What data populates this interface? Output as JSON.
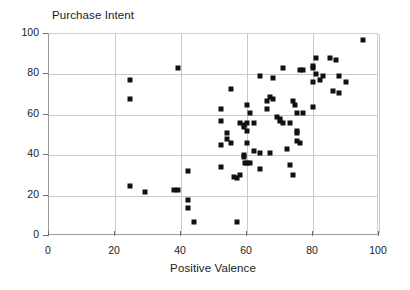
{
  "chart_data": {
    "type": "scatter",
    "title": "Purchase Intent",
    "xlabel": "Positive Valence",
    "ylabel": "Purchase Intent",
    "xlim": [
      0,
      100
    ],
    "ylim": [
      0,
      100
    ],
    "xticks": [
      0,
      20,
      40,
      60,
      80,
      100
    ],
    "yticks": [
      0,
      20,
      40,
      60,
      80,
      100
    ],
    "grid": true,
    "legend": null,
    "marker": "square",
    "marker_color": "#111111",
    "points": [
      [
        24.5,
        77
      ],
      [
        24.5,
        68
      ],
      [
        24.5,
        25
      ],
      [
        29,
        22
      ],
      [
        38,
        23
      ],
      [
        39,
        23
      ],
      [
        39,
        83
      ],
      [
        42,
        32
      ],
      [
        42,
        18
      ],
      [
        42,
        14
      ],
      [
        44,
        7
      ],
      [
        52,
        63
      ],
      [
        52,
        57
      ],
      [
        52,
        45
      ],
      [
        52,
        34
      ],
      [
        55,
        73
      ],
      [
        54,
        51
      ],
      [
        54,
        48
      ],
      [
        55,
        46
      ],
      [
        56,
        29
      ],
      [
        57,
        28.5
      ],
      [
        57,
        7
      ],
      [
        58,
        30
      ],
      [
        58,
        56
      ],
      [
        59,
        55
      ],
      [
        59,
        54
      ],
      [
        59,
        40
      ],
      [
        59,
        39
      ],
      [
        59.5,
        36
      ],
      [
        60,
        36
      ],
      [
        60,
        65
      ],
      [
        60,
        56
      ],
      [
        60,
        52
      ],
      [
        60,
        46
      ],
      [
        61,
        36
      ],
      [
        61,
        61
      ],
      [
        62,
        42
      ],
      [
        62,
        56
      ],
      [
        64,
        79
      ],
      [
        64,
        41
      ],
      [
        64,
        33
      ],
      [
        66,
        67
      ],
      [
        66,
        63
      ],
      [
        67,
        69
      ],
      [
        67,
        41
      ],
      [
        68,
        78
      ],
      [
        68,
        68
      ],
      [
        69,
        59
      ],
      [
        70,
        58
      ],
      [
        70,
        57
      ],
      [
        71,
        56
      ],
      [
        71,
        83
      ],
      [
        72,
        43
      ],
      [
        73,
        56
      ],
      [
        73,
        35
      ],
      [
        74,
        30
      ],
      [
        74,
        67
      ],
      [
        74.5,
        65
      ],
      [
        75,
        61
      ],
      [
        75,
        52
      ],
      [
        75,
        51
      ],
      [
        75,
        47
      ],
      [
        76,
        46
      ],
      [
        76,
        82
      ],
      [
        77,
        82
      ],
      [
        77,
        61
      ],
      [
        80,
        84
      ],
      [
        80,
        83
      ],
      [
        80,
        64
      ],
      [
        80,
        76
      ],
      [
        81,
        88
      ],
      [
        81,
        80
      ],
      [
        82,
        77
      ],
      [
        83,
        79
      ],
      [
        85,
        88
      ],
      [
        86,
        72
      ],
      [
        87,
        87
      ],
      [
        88,
        79
      ],
      [
        88,
        71
      ],
      [
        90,
        76
      ],
      [
        95,
        97
      ]
    ]
  },
  "axis": {
    "x_tick_labels": [
      "0",
      "20",
      "40",
      "60",
      "80",
      "100"
    ],
    "y_tick_labels": [
      "0",
      "20",
      "40",
      "60",
      "80",
      "100"
    ]
  }
}
